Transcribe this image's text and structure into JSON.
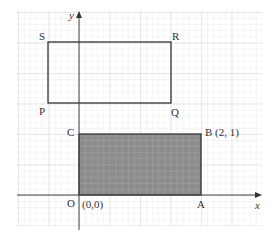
{
  "diagram": {
    "type": "coordinate-grid",
    "axes": {
      "x_label": "x",
      "y_label": "y"
    },
    "origin": {
      "label": "O",
      "coord_label": "(0,0)"
    },
    "shaded_rectangle": {
      "vertices": [
        "O",
        "A",
        "B",
        "C"
      ],
      "B_label": "B (2, 1)",
      "labels": {
        "O": "O",
        "A": "A",
        "B": "B (2, 1)",
        "C": "C"
      },
      "fill": "#8a8a8a"
    },
    "outline_rectangle": {
      "vertices": [
        "P",
        "Q",
        "R",
        "S"
      ],
      "labels": {
        "P": "P",
        "Q": "Q",
        "R": "R",
        "S": "S"
      }
    },
    "colors": {
      "grid": "#d9d9d9",
      "axis": "#444444",
      "outline": "#333333"
    }
  }
}
